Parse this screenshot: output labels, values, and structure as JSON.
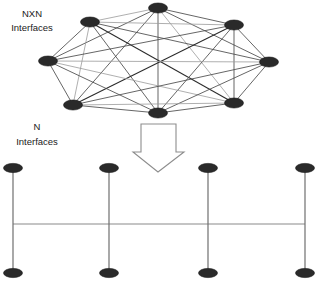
{
  "diagram": {
    "background_color": "#ffffff",
    "node_color": "#2a2a2a",
    "mesh_edge_color": "#4a4a4a",
    "bus_line_color": "#8a8a8a",
    "arrow_outline_color": "#8d8d8d",
    "labels": {
      "mesh_line1": "NXN",
      "mesh_line2": "Interfaces",
      "bus_line1": "N",
      "bus_line2": "Interfaces"
    },
    "mesh": {
      "type": "fully-connected-mesh",
      "node_count": 8,
      "edge_count": 28,
      "nodes": [
        {
          "id": "m1",
          "x": 158,
          "y": 8,
          "rx": 9.5,
          "ry": 5.0
        },
        {
          "id": "m2",
          "x": 90,
          "y": 22,
          "rx": 9.5,
          "ry": 5.0
        },
        {
          "id": "m3",
          "x": 234,
          "y": 25,
          "rx": 9.5,
          "ry": 5.0
        },
        {
          "id": "m4",
          "x": 48,
          "y": 61,
          "rx": 9.5,
          "ry": 5.0
        },
        {
          "id": "m5",
          "x": 269,
          "y": 62,
          "rx": 9.5,
          "ry": 5.0
        },
        {
          "id": "m6",
          "x": 73,
          "y": 105,
          "rx": 9.5,
          "ry": 5.0
        },
        {
          "id": "m7",
          "x": 234,
          "y": 103,
          "rx": 9.5,
          "ry": 5.0
        },
        {
          "id": "m8",
          "x": 158,
          "y": 113,
          "rx": 9.5,
          "ry": 5.0
        }
      ],
      "edges": [
        [
          "m1",
          "m2"
        ],
        [
          "m1",
          "m3"
        ],
        [
          "m1",
          "m4"
        ],
        [
          "m1",
          "m5"
        ],
        [
          "m1",
          "m6"
        ],
        [
          "m1",
          "m7"
        ],
        [
          "m1",
          "m8"
        ],
        [
          "m2",
          "m3"
        ],
        [
          "m2",
          "m4"
        ],
        [
          "m2",
          "m5"
        ],
        [
          "m2",
          "m6"
        ],
        [
          "m2",
          "m7"
        ],
        [
          "m2",
          "m8"
        ],
        [
          "m3",
          "m4"
        ],
        [
          "m3",
          "m5"
        ],
        [
          "m3",
          "m6"
        ],
        [
          "m3",
          "m7"
        ],
        [
          "m3",
          "m8"
        ],
        [
          "m4",
          "m5"
        ],
        [
          "m4",
          "m6"
        ],
        [
          "m4",
          "m7"
        ],
        [
          "m4",
          "m8"
        ],
        [
          "m5",
          "m6"
        ],
        [
          "m5",
          "m7"
        ],
        [
          "m5",
          "m8"
        ],
        [
          "m6",
          "m7"
        ],
        [
          "m6",
          "m8"
        ],
        [
          "m7",
          "m8"
        ]
      ]
    },
    "arrow": {
      "direction": "down",
      "points": "141,124 176,124 176,152 184,152 158,172 133,152 141,152"
    },
    "bus": {
      "type": "linear-bus",
      "node_count": 8,
      "line_y": 224,
      "line_x1": 13,
      "line_x2": 305,
      "columns": [
        13,
        109,
        208,
        305
      ],
      "top_y": 168,
      "bottom_y": 273,
      "node_rx": 9.5,
      "node_ry": 4.6
    },
    "label_positions": {
      "mesh_label_x": 32,
      "mesh_label_y1": 17,
      "mesh_label_y2": 31,
      "bus_label_x": 37,
      "bus_label_y1": 130,
      "bus_label_y2": 145
    }
  }
}
